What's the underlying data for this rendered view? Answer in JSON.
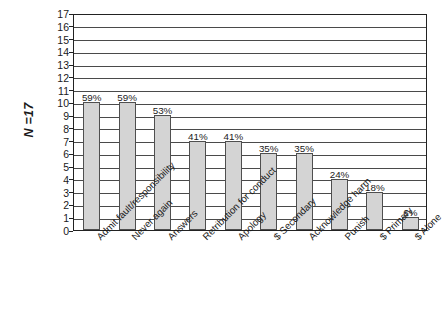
{
  "annotation": {
    "sample_size_label": "N =17"
  },
  "chart_data": {
    "type": "bar",
    "title": "",
    "subtitle": "",
    "xlabel": "",
    "ylabel": "",
    "ylim": [
      0,
      17
    ],
    "grid": true,
    "legend": false,
    "legend_position": "none",
    "bar_color": "#d4d4d4",
    "bar_border_color": "#4f4f4f",
    "gridline_color": "#4a4a4a",
    "axis_color": "#222222",
    "background_color": "#ffffff",
    "sample_size": 17,
    "categories": [
      "Admit fault/responsibility",
      "Never again",
      "Answers",
      "Retribution for conduct",
      "Apology",
      "$ Secondary",
      "Acknowledge harm",
      "Punish",
      "$ Primary",
      "$ Alone"
    ],
    "values": [
      10,
      10,
      9,
      7,
      7,
      6,
      6,
      4,
      3,
      1
    ],
    "data_labels": [
      "59%",
      "59%",
      "53%",
      "41%",
      "41%",
      "35%",
      "35%",
      "24%",
      "18%",
      "6%"
    ],
    "yticks": [
      0,
      1,
      2,
      3,
      4,
      5,
      6,
      7,
      8,
      9,
      10,
      11,
      12,
      13,
      14,
      15,
      16,
      17
    ],
    "ytick_labels": [
      "0",
      "1",
      "2",
      "3",
      "4",
      "5",
      "6",
      "7",
      "8",
      "9",
      "10",
      "11",
      "12",
      "13",
      "14",
      "15",
      "16",
      "17"
    ]
  }
}
